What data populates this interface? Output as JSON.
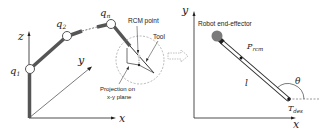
{
  "left_panel": {
    "axes": {
      "z": "z",
      "y": "y",
      "x": "x"
    },
    "joints": {
      "q1": "q",
      "q1_sub": "1",
      "q2": "q",
      "q2_sub": "2",
      "qn": "q",
      "qn_sub": "n"
    },
    "labels": {
      "rcm_point": "RCM point",
      "tool": "Tool",
      "projection_line1": "Projection on",
      "projection_line2": "x-y plane"
    }
  },
  "right_panel": {
    "axes": {
      "y": "y",
      "x": "x"
    },
    "labels": {
      "end_effector": "Robot end-effector",
      "p_rcm": "P",
      "p_rcm_sub": "rcm",
      "length": "l",
      "theta": "θ",
      "t_des": "T",
      "t_des_sub": "des"
    }
  },
  "colors": {
    "link": "#555555",
    "joint_fill": "#ffffff",
    "end_effector": "#7a7a7a",
    "dashed": "#999999"
  }
}
